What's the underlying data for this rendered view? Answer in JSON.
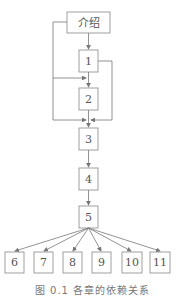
{
  "diagram": {
    "title": "图 0.1   各章的依赖关系",
    "nodes": [
      {
        "id": "intro",
        "label": "介绍"
      },
      {
        "id": "n1",
        "label": "1"
      },
      {
        "id": "n2",
        "label": "2"
      },
      {
        "id": "n3",
        "label": "3"
      },
      {
        "id": "n4",
        "label": "4"
      },
      {
        "id": "n5",
        "label": "5"
      },
      {
        "id": "n6",
        "label": "6"
      },
      {
        "id": "n7",
        "label": "7"
      },
      {
        "id": "n8",
        "label": "8"
      },
      {
        "id": "n9",
        "label": "9"
      },
      {
        "id": "n10",
        "label": "10"
      },
      {
        "id": "n11",
        "label": "11"
      }
    ],
    "edges": [
      [
        "介绍",
        "1"
      ],
      [
        "介绍",
        "2"
      ],
      [
        "介绍",
        "3"
      ],
      [
        "1",
        "2"
      ],
      [
        "1",
        "3"
      ],
      [
        "2",
        "3"
      ],
      [
        "3",
        "4"
      ],
      [
        "4",
        "5"
      ],
      [
        "5",
        "6"
      ],
      [
        "5",
        "7"
      ],
      [
        "5",
        "8"
      ],
      [
        "5",
        "9"
      ],
      [
        "5",
        "10"
      ],
      [
        "5",
        "11"
      ]
    ],
    "colors": {
      "line": "#777777",
      "box": "#888888",
      "text": "#555555"
    }
  }
}
